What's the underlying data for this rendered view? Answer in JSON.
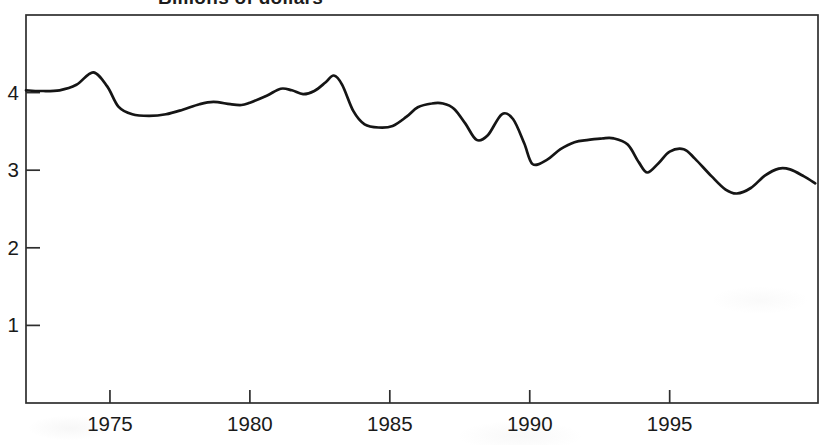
{
  "chart_data": {
    "type": "line",
    "title": "Billions of dollars",
    "xlabel": "",
    "ylabel": "",
    "xlim": [
      1972,
      2000.3
    ],
    "ylim": [
      0,
      5
    ],
    "grid": false,
    "legend": "none",
    "frame": true,
    "line_color": "#151515",
    "frame_color": "#2e2e2e",
    "text_color": "#1a1a1a",
    "x_tick_values": [
      1975,
      1980,
      1985,
      1990,
      1995
    ],
    "x_tick_labels": [
      "1975",
      "1980",
      "1985",
      "1990",
      "1995"
    ],
    "y_tick_values": [
      1,
      2,
      3,
      4
    ],
    "y_tick_labels": [
      "1",
      "2",
      "3",
      "4"
    ],
    "series": [
      {
        "name": "value",
        "points": [
          [
            1972.0,
            4.03
          ],
          [
            1972.5,
            4.02
          ],
          [
            1973.2,
            4.03
          ],
          [
            1973.8,
            4.1
          ],
          [
            1974.4,
            4.26
          ],
          [
            1974.9,
            4.08
          ],
          [
            1975.3,
            3.82
          ],
          [
            1975.8,
            3.72
          ],
          [
            1976.4,
            3.7
          ],
          [
            1977.0,
            3.72
          ],
          [
            1977.6,
            3.78
          ],
          [
            1978.2,
            3.85
          ],
          [
            1978.7,
            3.88
          ],
          [
            1979.3,
            3.85
          ],
          [
            1979.7,
            3.84
          ],
          [
            1980.0,
            3.87
          ],
          [
            1980.6,
            3.96
          ],
          [
            1981.1,
            4.05
          ],
          [
            1981.5,
            4.03
          ],
          [
            1981.9,
            3.98
          ],
          [
            1982.3,
            4.02
          ],
          [
            1982.7,
            4.13
          ],
          [
            1983.0,
            4.22
          ],
          [
            1983.3,
            4.1
          ],
          [
            1983.7,
            3.76
          ],
          [
            1984.1,
            3.59
          ],
          [
            1984.6,
            3.55
          ],
          [
            1985.1,
            3.57
          ],
          [
            1985.6,
            3.69
          ],
          [
            1986.0,
            3.81
          ],
          [
            1986.5,
            3.86
          ],
          [
            1986.9,
            3.86
          ],
          [
            1987.3,
            3.79
          ],
          [
            1987.7,
            3.6
          ],
          [
            1988.1,
            3.39
          ],
          [
            1988.5,
            3.45
          ],
          [
            1989.0,
            3.72
          ],
          [
            1989.4,
            3.66
          ],
          [
            1989.8,
            3.35
          ],
          [
            1990.1,
            3.08
          ],
          [
            1990.6,
            3.13
          ],
          [
            1991.1,
            3.27
          ],
          [
            1991.6,
            3.36
          ],
          [
            1992.1,
            3.39
          ],
          [
            1992.6,
            3.41
          ],
          [
            1993.0,
            3.41
          ],
          [
            1993.5,
            3.33
          ],
          [
            1993.9,
            3.1
          ],
          [
            1994.2,
            2.97
          ],
          [
            1994.6,
            3.09
          ],
          [
            1995.0,
            3.24
          ],
          [
            1995.5,
            3.27
          ],
          [
            1995.9,
            3.15
          ],
          [
            1996.5,
            2.92
          ],
          [
            1997.0,
            2.75
          ],
          [
            1997.4,
            2.7
          ],
          [
            1997.9,
            2.77
          ],
          [
            1998.4,
            2.93
          ],
          [
            1998.9,
            3.02
          ],
          [
            1999.3,
            3.01
          ],
          [
            1999.8,
            2.92
          ],
          [
            2000.2,
            2.83
          ]
        ]
      }
    ]
  }
}
